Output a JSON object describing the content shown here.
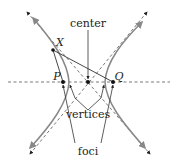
{
  "diagram": {
    "type": "hyperbola",
    "labels": {
      "center": "center",
      "vertices": "vertices",
      "foci": "foci",
      "point_x": "X",
      "point_p": "P",
      "point_q": "Q"
    },
    "colors": {
      "curve": "#888888",
      "line": "#333333",
      "dash": "#555555",
      "point": "#111111",
      "background": "#ffffff"
    }
  }
}
